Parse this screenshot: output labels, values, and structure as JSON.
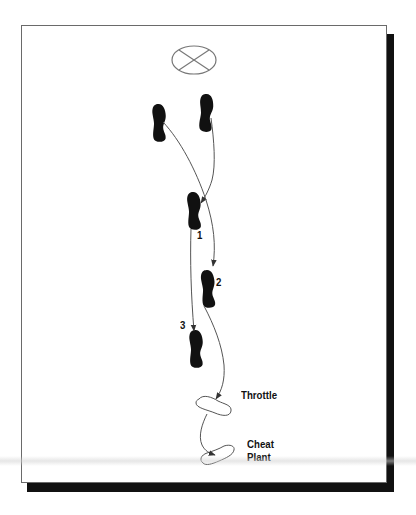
{
  "diagram": {
    "type": "footwork-diagram",
    "target_symbol": "target-circle-with-x",
    "start_position": [
      "left-foot",
      "right-foot"
    ],
    "steps": [
      {
        "number": "1",
        "foot": "right"
      },
      {
        "number": "2",
        "foot": "left"
      },
      {
        "number": "3",
        "foot": "right"
      }
    ],
    "labels": {
      "step1": "1",
      "step2": "2",
      "step3": "3",
      "throttle": "Throttle",
      "cheat_line1": "Cheat",
      "cheat_line2": "Plant"
    },
    "colors": {
      "footprint_fill": "#111111",
      "outline_foot": "#555555",
      "path_line": "#555555",
      "frame_border": "#6a6a6a",
      "shadow": "#111111"
    }
  }
}
